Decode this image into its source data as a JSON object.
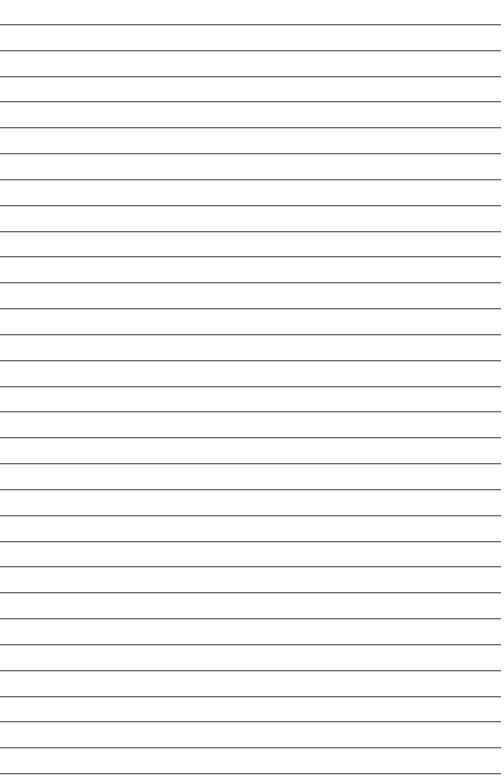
{
  "page": {
    "type": "lined-paper",
    "background_color": "#ffffff",
    "line_color": "#6b6b6b",
    "line_count": 30,
    "first_line_y": 24,
    "line_spacing": 25.83,
    "line_width": 501
  }
}
